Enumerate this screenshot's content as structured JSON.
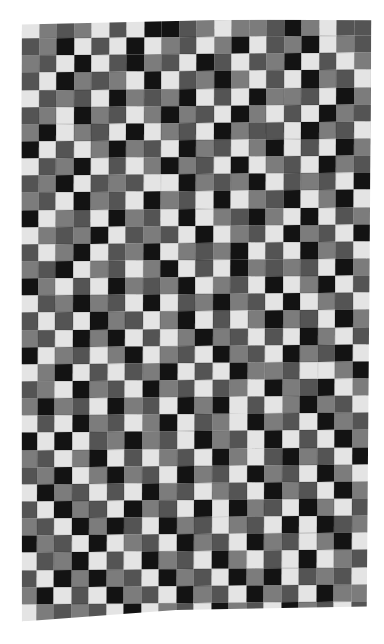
{
  "image": {
    "subject": "Checkerboard patchwork quilt in black, white and grays",
    "background": "#ffffff",
    "grid": {
      "columns": 20,
      "rows": 35
    },
    "palette": [
      "#151515",
      "#555555",
      "#7c7c7c",
      "#e2e2e2"
    ],
    "pattern_rows": [
      "32123130012322102311",
      "12031303213203120321",
      "21303102130131203132",
      "13021230312023130213",
      "31213021203130221302",
      "12302132021302313021",
      "20321303213021130213",
      "03132021302132031302",
      "31203132021303213021",
      "12031213302120312130",
      "21302130213032103203",
      "03213021303210230312",
      "32120312130321302130",
      "13203120321203130213",
      "21032132031302121302",
      "02313021203213032031",
      "31202130312021303213",
      "13130213203132021302",
      "21302031320213130231",
      "03213203213021302103",
      "32031312031302213320",
      "12302130213123021032",
      "20213021302031320213",
      "31302132031230213021",
      "03031202130213031302",
      "21320313213023102130",
      "12032021302130213023",
      "30213130213213021302",
      "13021302130302130231",
      "21302013021321303012",
      "02130321302130213203",
      "31203130213023130321",
      "13020213021302031213",
      "20313021302130213022",
      "32121303213021302131"
    ]
  }
}
